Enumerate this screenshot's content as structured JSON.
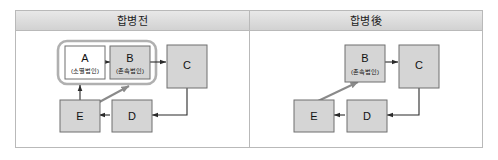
{
  "figure": {
    "panels": [
      {
        "id": "before",
        "title": "합병전",
        "group_box": {
          "label": "merged-group"
        },
        "nodes": [
          {
            "id": "A",
            "label": "A",
            "sublabel": "(소멸법인)",
            "fill": "#ffffff"
          },
          {
            "id": "B",
            "label": "B",
            "sublabel": "(존속법인)",
            "fill": "#d5d5d5"
          },
          {
            "id": "C",
            "label": "C",
            "sublabel": "",
            "fill": "#d5d5d5"
          },
          {
            "id": "D",
            "label": "D",
            "sublabel": "",
            "fill": "#d5d5d5"
          },
          {
            "id": "E",
            "label": "E",
            "sublabel": "",
            "fill": "#d5d5d5"
          }
        ],
        "edges": [
          {
            "from": "A",
            "to": "B",
            "style": "thin"
          },
          {
            "from": "B",
            "to": "C",
            "style": "thin"
          },
          {
            "from": "C",
            "to": "D",
            "style": "thin"
          },
          {
            "from": "D",
            "to": "E",
            "style": "thin"
          },
          {
            "from": "E",
            "to": "A",
            "style": "thin"
          },
          {
            "from": "E",
            "to": "B",
            "style": "thick"
          }
        ]
      },
      {
        "id": "after",
        "title": "합병後",
        "nodes": [
          {
            "id": "B",
            "label": "B",
            "sublabel": "(존속법인)",
            "fill": "#d5d5d5"
          },
          {
            "id": "C",
            "label": "C",
            "sublabel": "",
            "fill": "#d5d5d5"
          },
          {
            "id": "D",
            "label": "D",
            "sublabel": "",
            "fill": "#d5d5d5"
          },
          {
            "id": "E",
            "label": "E",
            "sublabel": "",
            "fill": "#d5d5d5"
          }
        ],
        "edges": [
          {
            "from": "B",
            "to": "C",
            "style": "thin"
          },
          {
            "from": "C",
            "to": "D",
            "style": "thin"
          },
          {
            "from": "D",
            "to": "E",
            "style": "thin"
          },
          {
            "from": "E",
            "to": "B",
            "style": "thick"
          }
        ]
      }
    ],
    "colors": {
      "node_fill": "#d5d5d5",
      "node_fill_white": "#ffffff",
      "node_stroke": "#6f6f6f",
      "edge_thin": "#2b2b2b",
      "edge_thick": "#8a8a8a",
      "frame_stroke": "#b9b9b9",
      "header_band": "#dedede"
    }
  }
}
